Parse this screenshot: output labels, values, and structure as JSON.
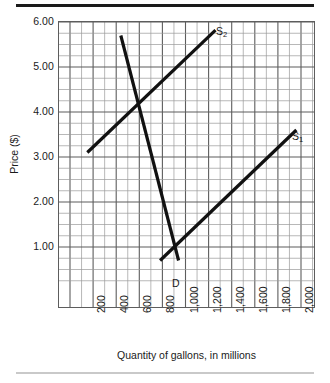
{
  "figure": {
    "y_axis_title": "Price ($)",
    "x_axis_title": "Quantity of gallons, in millions"
  },
  "curve_labels": {
    "s2": "S",
    "s2_sub": "2",
    "s1": "S",
    "s1_sub": "1",
    "d": "D"
  },
  "chart_data": {
    "type": "line",
    "title": "",
    "subtitle": "",
    "xlabel": "Quantity of gallons, in millions",
    "ylabel": "Price ($)",
    "xlim": [
      0,
      2100
    ],
    "ylim": [
      0.25,
      6.0
    ],
    "grid": true,
    "grid_major_x_step": 200,
    "grid_minor_x_step": 100,
    "grid_major_y_step": 1.0,
    "grid_minor_y_step": 0.25,
    "legend_position": "inline-curve-labels",
    "x_tick_labels": [
      "200",
      "400",
      "600",
      "800",
      "1,000",
      "1,200",
      "1,400",
      "1,600",
      "1,800",
      "2,000"
    ],
    "x_tick_values": [
      200,
      400,
      600,
      800,
      1000,
      1200,
      1400,
      1600,
      1800,
      2000
    ],
    "y_tick_labels": [
      "1.00",
      "2.00",
      "3.00",
      "4.00",
      "5.00",
      "6.00"
    ],
    "y_tick_values": [
      1.0,
      2.0,
      3.0,
      4.0,
      5.0,
      6.0
    ],
    "series": [
      {
        "name": "D",
        "label": "D",
        "kind": "demand",
        "color": "#111111",
        "points": [
          {
            "x": 440,
            "y": 5.7
          },
          {
            "x": 940,
            "y": 0.7
          }
        ]
      },
      {
        "name": "S2",
        "label": "S2",
        "kind": "supply",
        "color": "#111111",
        "points": [
          {
            "x": 150,
            "y": 3.1
          },
          {
            "x": 1260,
            "y": 5.82
          }
        ]
      },
      {
        "name": "S1",
        "label": "S1",
        "kind": "supply",
        "color": "#111111",
        "points": [
          {
            "x": 780,
            "y": 0.7
          },
          {
            "x": 1960,
            "y": 3.6
          }
        ]
      }
    ],
    "annotations": [
      {
        "text": "S2",
        "x": 1290,
        "y": 5.78
      },
      {
        "text": "S1",
        "x": 2010,
        "y": 3.6
      },
      {
        "text": "D",
        "x": 1000,
        "y": 0.63
      }
    ]
  }
}
